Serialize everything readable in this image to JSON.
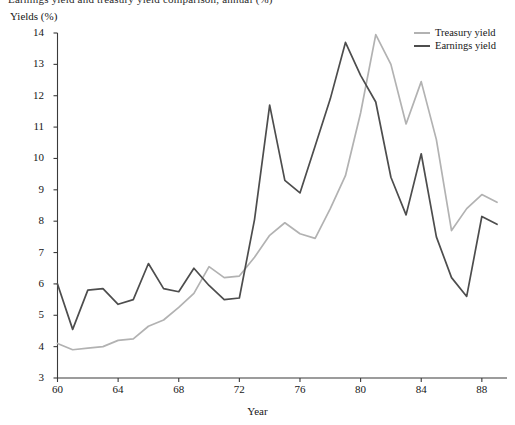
{
  "figure": {
    "title": "Earnings yield and treasury yield comparison, annual (%)",
    "ylabel": "Yields (%)",
    "xlabel": "Year"
  },
  "legend": {
    "position": "top-right",
    "entries": [
      {
        "label": "Treasury yield",
        "color": "#b2b2b2"
      },
      {
        "label": "Earnings yield",
        "color": "#4d4d4d"
      }
    ]
  },
  "axes": {
    "y_ticks": [
      "14",
      "13",
      "12",
      "11",
      "10",
      "9",
      "8",
      "7",
      "6",
      "5",
      "4",
      "3"
    ],
    "x_ticks": [
      "60",
      "64",
      "68",
      "72",
      "76",
      "80",
      "84",
      "88"
    ]
  },
  "chart_data": {
    "type": "line",
    "title": "Earnings yield and treasury yield comparison, annual (%)",
    "xlabel": "Year",
    "ylabel": "Yields (%)",
    "xlim": [
      60,
      89
    ],
    "ylim": [
      3,
      14
    ],
    "grid": false,
    "legend_position": "top-right",
    "x": [
      60,
      61,
      62,
      63,
      64,
      65,
      66,
      67,
      68,
      69,
      70,
      71,
      72,
      73,
      74,
      75,
      76,
      77,
      78,
      79,
      80,
      81,
      82,
      83,
      84,
      85,
      86,
      87,
      88,
      89
    ],
    "series": [
      {
        "name": "Treasury yield",
        "color": "#b2b2b2",
        "values": [
          4.1,
          3.9,
          3.95,
          4.0,
          4.2,
          4.25,
          4.65,
          4.85,
          5.25,
          5.7,
          6.55,
          6.2,
          6.25,
          6.85,
          7.55,
          7.95,
          7.6,
          7.45,
          8.4,
          9.45,
          11.45,
          13.95,
          13.0,
          11.1,
          12.45,
          10.6,
          7.7,
          8.4,
          8.85,
          8.6
        ]
      },
      {
        "name": "Earnings yield",
        "color": "#4d4d4d",
        "values": [
          6.0,
          4.55,
          5.8,
          5.85,
          5.35,
          5.5,
          6.65,
          5.85,
          5.75,
          6.5,
          5.95,
          5.5,
          5.55,
          8.05,
          11.7,
          9.3,
          8.9,
          10.4,
          11.9,
          13.7,
          12.65,
          11.8,
          9.4,
          8.2,
          10.15,
          7.5,
          6.2,
          5.6,
          8.15,
          7.9
        ]
      }
    ]
  }
}
